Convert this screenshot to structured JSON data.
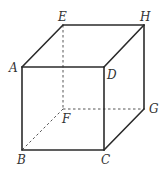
{
  "figure": {
    "type": "cube",
    "vertices": {
      "A": {
        "label": "A",
        "x": 22,
        "y": 67
      },
      "B": {
        "label": "B",
        "x": 22,
        "y": 150
      },
      "C": {
        "label": "C",
        "x": 104,
        "y": 150
      },
      "D": {
        "label": "D",
        "x": 104,
        "y": 67
      },
      "E": {
        "label": "E",
        "x": 63,
        "y": 25
      },
      "F": {
        "label": "F",
        "x": 63,
        "y": 109
      },
      "G": {
        "label": "G",
        "x": 144,
        "y": 109
      },
      "H": {
        "label": "H",
        "x": 144,
        "y": 25
      }
    },
    "visible_edges": [
      "AB",
      "BC",
      "CD",
      "DA",
      "AE",
      "EH",
      "HD",
      "HG",
      "GC"
    ],
    "hidden_edges": [
      "EF",
      "FB",
      "FG"
    ],
    "colors": {
      "edge": "#2b2b2b",
      "hidden_edge": "#555555",
      "label": "#333333"
    }
  }
}
